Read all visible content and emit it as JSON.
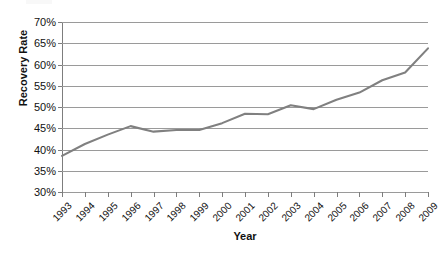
{
  "chart_data": {
    "type": "line",
    "title": "",
    "xlabel": "Year",
    "ylabel": "Recovery Rate",
    "grid": true,
    "legend": false,
    "x": [
      1993,
      1994,
      1995,
      1996,
      1997,
      1998,
      1999,
      2000,
      2001,
      2002,
      2003,
      2004,
      2005,
      2006,
      2007,
      2008,
      2009
    ],
    "categories": [
      "1993",
      "1994",
      "1995",
      "1996",
      "1997",
      "1998",
      "1999",
      "2000",
      "2001",
      "2002",
      "2003",
      "2004",
      "2005",
      "2006",
      "2007",
      "2008",
      "2009"
    ],
    "values": [
      38.5,
      41.3,
      43.5,
      45.5,
      44.2,
      44.6,
      44.6,
      46.2,
      48.4,
      48.3,
      50.4,
      49.5,
      51.7,
      53.4,
      56.3,
      58.1,
      63.8
    ],
    "series": [
      {
        "name": "Recovery Rate",
        "color": "#808080",
        "values": [
          38.5,
          41.3,
          43.5,
          45.5,
          44.2,
          44.6,
          44.6,
          46.2,
          48.4,
          48.3,
          50.4,
          49.5,
          51.7,
          53.4,
          56.3,
          58.1,
          63.8
        ]
      }
    ],
    "ylim": [
      30,
      70
    ],
    "ytick_values": [
      70,
      65,
      60,
      55,
      50,
      45,
      40,
      35,
      30
    ],
    "ytick_labels": [
      "70%",
      "65%",
      "60%",
      "55%",
      "50%",
      "45%",
      "40%",
      "35%",
      "30%"
    ],
    "yunit": "%",
    "xlim": [
      1993,
      2009
    ],
    "colors": {
      "line": "#808080",
      "gridline": "#9a9a9a",
      "axis": "#7d7d7d",
      "text": "#111111",
      "background": "#ffffff"
    }
  }
}
